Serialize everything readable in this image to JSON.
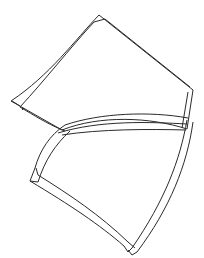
{
  "figure": {
    "panels": [
      {
        "name": "upper-panel"
      },
      {
        "name": "lower-panel"
      }
    ],
    "stroke_color": "#2a2a2a",
    "background": "#ffffff"
  }
}
